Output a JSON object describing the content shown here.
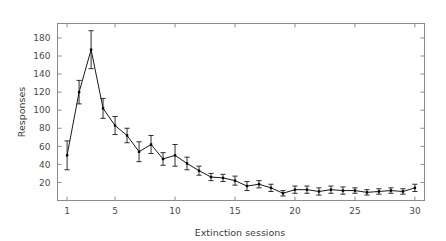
{
  "chart_data": {
    "type": "line",
    "title": "",
    "xlabel": "Extinction sessions",
    "ylabel": "Responses",
    "xlim": [
      0.2,
      30.8
    ],
    "ylim": [
      0,
      196
    ],
    "grid": false,
    "legend": null,
    "marker": "filled-square",
    "error_bars": "vertical",
    "line_color": "#1a1a1a",
    "marker_color": "#000000",
    "frame_color": "#8c8c8c",
    "background_color": "#ffffff",
    "xticks": [
      1,
      5,
      10,
      15,
      20,
      25,
      30
    ],
    "xtick_labels": [
      "1",
      "5",
      "10",
      "15",
      "20",
      "25",
      "30"
    ],
    "yticks": [
      20,
      40,
      60,
      80,
      100,
      120,
      140,
      160,
      180
    ],
    "ytick_labels": [
      "20",
      "40",
      "60",
      "80",
      "100",
      "120",
      "140",
      "160",
      "180"
    ],
    "x": [
      1,
      2,
      3,
      4,
      5,
      6,
      7,
      8,
      9,
      10,
      11,
      12,
      13,
      14,
      15,
      16,
      17,
      18,
      19,
      20,
      21,
      22,
      23,
      24,
      25,
      26,
      27,
      28,
      29,
      30
    ],
    "values": [
      50,
      120,
      167,
      102,
      83,
      72,
      54,
      62,
      46,
      50,
      41,
      33,
      26,
      25,
      22,
      16,
      18,
      14,
      8,
      12,
      12,
      10,
      12,
      11,
      11,
      9,
      10,
      11,
      10,
      14
    ],
    "errors": [
      16,
      13,
      21,
      11,
      10,
      8,
      11,
      10,
      7,
      12,
      7,
      5,
      4,
      4,
      5,
      5,
      4,
      4,
      3,
      4,
      4,
      4,
      4,
      4,
      3,
      3,
      3,
      3,
      3,
      4
    ],
    "series": [
      {
        "name": "Responses",
        "values": [
          50,
          120,
          167,
          102,
          83,
          72,
          54,
          62,
          46,
          50,
          41,
          33,
          26,
          25,
          22,
          16,
          18,
          14,
          8,
          12,
          12,
          10,
          12,
          11,
          11,
          9,
          10,
          11,
          10,
          14
        ]
      }
    ]
  }
}
